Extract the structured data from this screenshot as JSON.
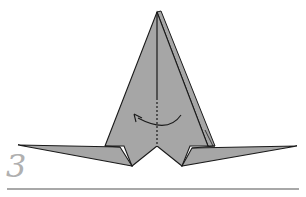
{
  "step": {
    "number": "3"
  },
  "diagram": {
    "paper_color": "#a6a6a6",
    "line_color": "#1a1a1a",
    "rule_color": "#a8a8a8",
    "step_number_color": "#b0b0b0",
    "annotations": [
      {
        "type": "valley-fold-line",
        "orientation": "vertical",
        "style": "dashed"
      },
      {
        "type": "fold-arrow",
        "direction": "right-to-left"
      }
    ]
  }
}
